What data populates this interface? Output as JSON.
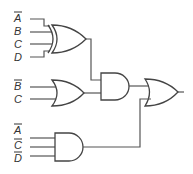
{
  "diagram": {
    "type": "logic-circuit",
    "gates": [
      {
        "id": "xor1",
        "type": "XOR",
        "inputs": [
          "A̅",
          "B",
          "C",
          "D"
        ]
      },
      {
        "id": "or1",
        "type": "OR",
        "inputs": [
          "B̅",
          "C"
        ]
      },
      {
        "id": "and1",
        "type": "AND",
        "inputs": [
          "xor1",
          "or1"
        ]
      },
      {
        "id": "and2",
        "type": "AND",
        "inputs": [
          "A̅",
          "C̅",
          "D̅"
        ]
      },
      {
        "id": "or2",
        "type": "OR",
        "inputs": [
          "and1",
          "and2"
        ],
        "output": true
      }
    ],
    "labels": {
      "xor1_in": [
        {
          "text": "A",
          "negated": true
        },
        {
          "text": "B",
          "negated": false
        },
        {
          "text": "C",
          "negated": false
        },
        {
          "text": "D",
          "negated": false
        }
      ],
      "or1_in": [
        {
          "text": "B",
          "negated": true
        },
        {
          "text": "C",
          "negated": false
        }
      ],
      "and2_in": [
        {
          "text": "A",
          "negated": true
        },
        {
          "text": "C",
          "negated": true
        },
        {
          "text": "D",
          "negated": true
        }
      ]
    }
  }
}
